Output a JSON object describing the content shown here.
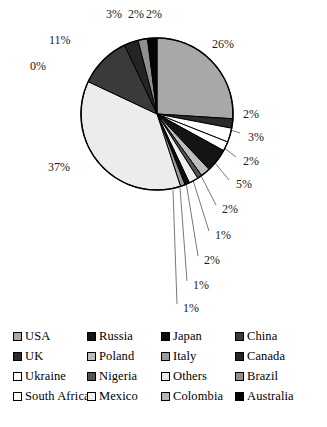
{
  "chart_data": {
    "type": "pie",
    "title": "",
    "subtitle": "",
    "xlabel": "",
    "ylabel": "",
    "legend_position": "bottom",
    "grid": false,
    "start_angle_deg": 0,
    "direction": "clockwise",
    "categories": [
      "USA",
      "UK",
      "Ukraine",
      "South Africa",
      "Russia",
      "Poland",
      "Nigeria",
      "Mexico",
      "Japan",
      "Italy",
      "Others",
      "Colombia",
      "China",
      "Canada",
      "Brazil",
      "Australia"
    ],
    "values": [
      26,
      2,
      3,
      2,
      5,
      2,
      1,
      2,
      1,
      1,
      37,
      0,
      11,
      3,
      2,
      2
    ],
    "value_unit": "%",
    "data_labels": [
      "26%",
      "2%",
      "3%",
      "2%",
      "5%",
      "2%",
      "1%",
      "2%",
      "1%",
      "1%",
      "37%",
      "0%",
      "11%",
      "3%",
      "2%",
      "2%"
    ],
    "colors": [
      "#a8a8a8",
      "#2b2b2b",
      "#ffffff",
      "#ffffff",
      "#141414",
      "#bdbdbd",
      "#545454",
      "#f0f0f0",
      "#0d0d0d",
      "#9c9c9c",
      "#ececec",
      "#b5b5b5",
      "#3a3a3a",
      "#242424",
      "#8f8f8f",
      "#050505"
    ],
    "slices": [
      {
        "label": "USA",
        "value": 26,
        "display": "26%",
        "color": "#a8a8a8"
      },
      {
        "label": "UK",
        "value": 2,
        "display": "2%",
        "color": "#2b2b2b"
      },
      {
        "label": "Ukraine",
        "value": 3,
        "display": "3%",
        "color": "#ffffff"
      },
      {
        "label": "South Africa",
        "value": 2,
        "display": "2%",
        "color": "#ffffff"
      },
      {
        "label": "Russia",
        "value": 5,
        "display": "5%",
        "color": "#141414"
      },
      {
        "label": "Poland",
        "value": 2,
        "display": "2%",
        "color": "#bdbdbd"
      },
      {
        "label": "Nigeria",
        "value": 1,
        "display": "1%",
        "color": "#545454"
      },
      {
        "label": "Mexico",
        "value": 2,
        "display": "2%",
        "color": "#f0f0f0"
      },
      {
        "label": "Japan",
        "value": 1,
        "display": "1%",
        "color": "#0d0d0d"
      },
      {
        "label": "Italy",
        "value": 1,
        "display": "1%",
        "color": "#9c9c9c"
      },
      {
        "label": "Others",
        "value": 37,
        "display": "37%",
        "color": "#ececec"
      },
      {
        "label": "Colombia",
        "value": 0,
        "display": "0%",
        "color": "#b5b5b5"
      },
      {
        "label": "China",
        "value": 11,
        "display": "11%",
        "color": "#3a3a3a"
      },
      {
        "label": "Canada",
        "value": 3,
        "display": "3%",
        "color": "#242424"
      },
      {
        "label": "Brazil",
        "value": 2,
        "display": "2%",
        "color": "#8f8f8f"
      },
      {
        "label": "Australia",
        "value": 2,
        "display": "2%",
        "color": "#050505"
      }
    ]
  },
  "legend": {
    "items": [
      {
        "label": "USA",
        "color": "#a8a8a8"
      },
      {
        "label": "UK",
        "color": "#2b2b2b"
      },
      {
        "label": "Ukraine",
        "color": "#ffffff"
      },
      {
        "label": "South Africa",
        "color": "#ffffff"
      },
      {
        "label": "Russia",
        "color": "#141414"
      },
      {
        "label": "Poland",
        "color": "#bdbdbd"
      },
      {
        "label": "Nigeria",
        "color": "#545454"
      },
      {
        "label": "Mexico",
        "color": "#f0f0f0"
      },
      {
        "label": "Japan",
        "color": "#0d0d0d"
      },
      {
        "label": "Italy",
        "color": "#9c9c9c"
      },
      {
        "label": "Others",
        "color": "#ececec"
      },
      {
        "label": "Colombia",
        "color": "#b5b5b5"
      },
      {
        "label": "China",
        "color": "#3a3a3a"
      },
      {
        "label": "Canada",
        "color": "#242424"
      },
      {
        "label": "Brazil",
        "color": "#8f8f8f"
      },
      {
        "label": "Australia",
        "color": "#050505"
      }
    ],
    "column_order": [
      0,
      4,
      8,
      12,
      1,
      5,
      9,
      13,
      2,
      6,
      10,
      14,
      3,
      7,
      11,
      15
    ]
  },
  "labels": {
    "placements": [
      {
        "text": "26%",
        "x": 212,
        "y": 38,
        "leader": null
      },
      {
        "text": "2%",
        "x": 243,
        "y": 108,
        "leader": {
          "x1": 232,
          "y1": 113,
          "x2": 210,
          "y2": 117
        }
      },
      {
        "text": "3%",
        "x": 248,
        "y": 131,
        "leader": {
          "x1": 240,
          "y1": 133,
          "x2": 218,
          "y2": 126
        }
      },
      {
        "text": "2%",
        "x": 243,
        "y": 155,
        "leader": {
          "x1": 236,
          "y1": 157,
          "x2": 214,
          "y2": 140
        }
      },
      {
        "text": "5%",
        "x": 236,
        "y": 178,
        "leader": {
          "x1": 229,
          "y1": 180,
          "x2": 206,
          "y2": 152
        }
      },
      {
        "text": "2%",
        "x": 222,
        "y": 203,
        "leader": {
          "x1": 216,
          "y1": 205,
          "x2": 196,
          "y2": 166
        }
      },
      {
        "text": "1%",
        "x": 215,
        "y": 229,
        "leader": {
          "x1": 209,
          "y1": 231,
          "x2": 192,
          "y2": 177
        }
      },
      {
        "text": "2%",
        "x": 204,
        "y": 254,
        "leader": {
          "x1": 198,
          "y1": 256,
          "x2": 186,
          "y2": 182
        }
      },
      {
        "text": "1%",
        "x": 193,
        "y": 279,
        "leader": {
          "x1": 187,
          "y1": 281,
          "x2": 180,
          "y2": 188
        }
      },
      {
        "text": "1%",
        "x": 183,
        "y": 302,
        "leader": {
          "x1": 177,
          "y1": 304,
          "x2": 173,
          "y2": 190
        }
      },
      {
        "text": "37%",
        "x": 48,
        "y": 161,
        "leader": null
      },
      {
        "text": "0%",
        "x": 30,
        "y": 60,
        "leader": null
      },
      {
        "text": "11%",
        "x": 49,
        "y": 34,
        "leader": null
      },
      {
        "text": "3%",
        "x": 106,
        "y": 8,
        "leader": null
      },
      {
        "text": "2%",
        "x": 128,
        "y": 8,
        "leader": null
      },
      {
        "text": "2%",
        "x": 146,
        "y": 8,
        "leader": null
      }
    ]
  }
}
